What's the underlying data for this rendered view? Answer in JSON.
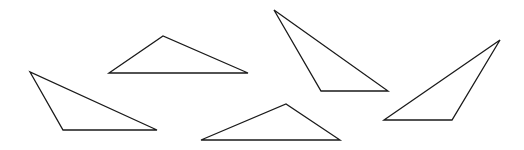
{
  "figure": {
    "width": 524,
    "height": 150,
    "background": "#ffffff",
    "stroke_color": "#1a1a1a",
    "triangles": [
      {
        "id": "triangle-1",
        "points": "109,73 163,36 248,73"
      },
      {
        "id": "triangle-2",
        "points": "30,72 63,130 157,130"
      },
      {
        "id": "triangle-3",
        "points": "201,140 286,104 340,140"
      },
      {
        "id": "triangle-4",
        "points": "274,10 321,91 388,91"
      },
      {
        "id": "triangle-5",
        "points": "384,120 500,40 452,120"
      }
    ]
  }
}
